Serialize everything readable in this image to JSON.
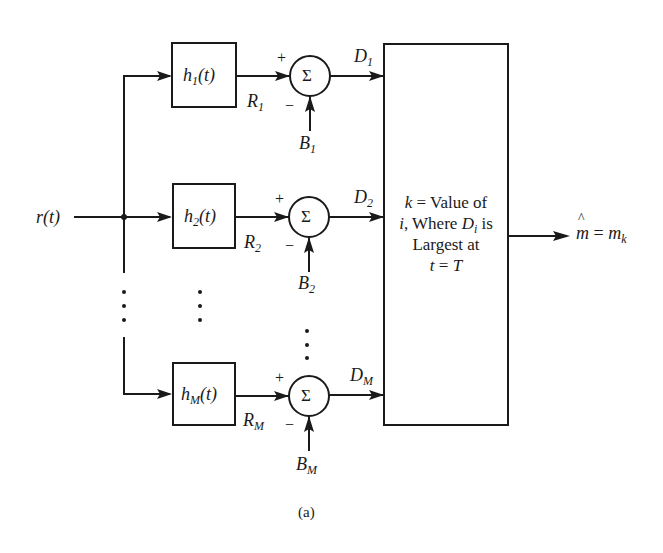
{
  "figure": {
    "caption": "(a)",
    "input": {
      "label": "r",
      "arg": "(t)"
    },
    "output": {
      "hat": "m",
      "eq": " = ",
      "var": "m",
      "sub": "k"
    },
    "branches": [
      {
        "filter": {
          "h": "h",
          "sub": "1",
          "arg": "(t)"
        },
        "R": {
          "var": "R",
          "sub": "1"
        },
        "B": {
          "var": "B",
          "sub": "1"
        },
        "D": {
          "var": "D",
          "sub": "1"
        },
        "sum_symbol": "Σ",
        "plus": "+",
        "minus": "−"
      },
      {
        "filter": {
          "h": "h",
          "sub": "2",
          "arg": "(t)"
        },
        "R": {
          "var": "R",
          "sub": "2"
        },
        "B": {
          "var": "B",
          "sub": "2"
        },
        "D": {
          "var": "D",
          "sub": "2"
        },
        "sum_symbol": "Σ",
        "plus": "+",
        "minus": "−"
      },
      {
        "filter": {
          "h": "h",
          "sub": "M",
          "arg": "(t)"
        },
        "R": {
          "var": "R",
          "sub": "M"
        },
        "B": {
          "var": "B",
          "sub": "M"
        },
        "D": {
          "var": "D",
          "sub": "M"
        },
        "sum_symbol": "Σ",
        "plus": "+",
        "minus": "−"
      }
    ],
    "decision_box": {
      "line1_var": "k",
      "line1_rest": " = Value of",
      "line2_var": "i",
      "line2_mid": ", Where ",
      "line2_D": "D",
      "line2_Dsub": "i",
      "line2_end": " is",
      "line3": "Largest at",
      "line4_var": "t",
      "line4_eq": " = ",
      "line4_T": "T"
    },
    "colors": {
      "ink": "#1a1a1a",
      "background": "#ffffff"
    }
  }
}
